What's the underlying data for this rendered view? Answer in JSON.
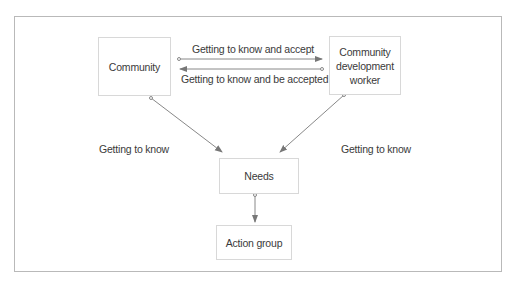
{
  "diagram": {
    "nodes": {
      "community": "Community",
      "cdw": "Community development worker",
      "needs": "Needs",
      "action_group": "Action group"
    },
    "edge_labels": {
      "know_and_accept": "Getting to know and accept",
      "know_and_be_accepted": "Getting to know and be accepted",
      "left_know": "Getting to know",
      "right_know": "Getting to know"
    },
    "colors": {
      "line": "#777777",
      "box_border": "#d8d8d8",
      "frame_border": "#b9b9b9",
      "text": "#3a3a3a"
    }
  }
}
